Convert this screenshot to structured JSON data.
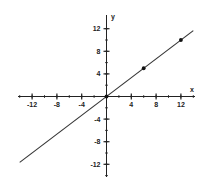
{
  "chart_data": {
    "type": "line",
    "title": "",
    "xlabel": "x",
    "ylabel": "y",
    "xlim": [
      -14,
      14
    ],
    "ylim": [
      -14,
      13
    ],
    "grid": false,
    "x_ticks": [
      -12,
      -8,
      -4,
      4,
      8,
      12
    ],
    "y_ticks": [
      12,
      8,
      4,
      -4,
      -8,
      -12
    ],
    "minor_tick_step": 2,
    "series": [
      {
        "name": "line",
        "equation": "y = (5/6)x",
        "x": [
          -14,
          14
        ],
        "y": [
          -11.67,
          11.67
        ]
      },
      {
        "name": "points",
        "type": "scatter",
        "x": [
          0,
          6,
          12
        ],
        "y": [
          0,
          5,
          10
        ]
      }
    ],
    "colors": {
      "axis": "#222222",
      "line": "#333333",
      "points": "#111111"
    }
  },
  "labels": {
    "x_axis": "x",
    "y_axis": "y",
    "x_ticks": [
      "-12",
      "-8",
      "-4",
      "4",
      "8",
      "12"
    ],
    "y_ticks": [
      "12",
      "8",
      "4",
      "-4",
      "-8",
      "-12"
    ]
  }
}
